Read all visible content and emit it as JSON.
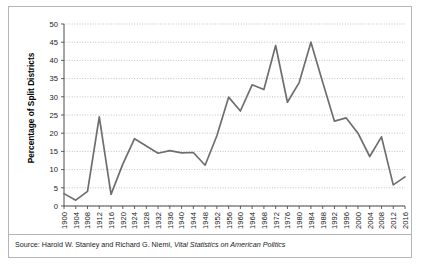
{
  "figure": {
    "ylabel": "Percentage of Split Districts",
    "source_prefix": "Source: Harold W. Stanley and Richard G. Niemi, ",
    "source_italic": "Vital Statistics on American Politics",
    "line_color": "#6e6e6e",
    "grid_color": "#a8a8a8",
    "axis_color": "#4d4d4d",
    "border_color": "#b5b5b5",
    "background": "#ffffff"
  },
  "chart_data": {
    "type": "line",
    "title": "",
    "xlabel": "",
    "ylabel": "Percentage of Split Districts",
    "ylim": [
      0,
      50
    ],
    "yticks": [
      0,
      5,
      10,
      15,
      20,
      25,
      30,
      35,
      40,
      45,
      50
    ],
    "grid": true,
    "legend": "none",
    "categories": [
      "1900",
      "1904",
      "1908",
      "1912",
      "1916",
      "1920",
      "1924",
      "1928",
      "1932",
      "1936",
      "1940",
      "1944",
      "1948",
      "1952",
      "1956",
      "1960",
      "1964",
      "1968",
      "1972",
      "1976",
      "1980",
      "1984",
      "1988",
      "1992",
      "1996",
      "2000",
      "2004",
      "2008",
      "2012",
      "2016"
    ],
    "values": [
      3.4,
      1.6,
      4.0,
      24.5,
      3.2,
      11.5,
      18.5,
      16.5,
      14.5,
      15.2,
      14.6,
      14.7,
      11.2,
      19.3,
      29.9,
      26.1,
      33.3,
      32.0,
      44.1,
      28.5,
      33.9,
      45.0,
      34.0,
      23.3,
      24.2,
      20.0,
      13.6,
      19.0,
      5.8,
      8.0
    ],
    "x_tick_rotation": -90
  }
}
